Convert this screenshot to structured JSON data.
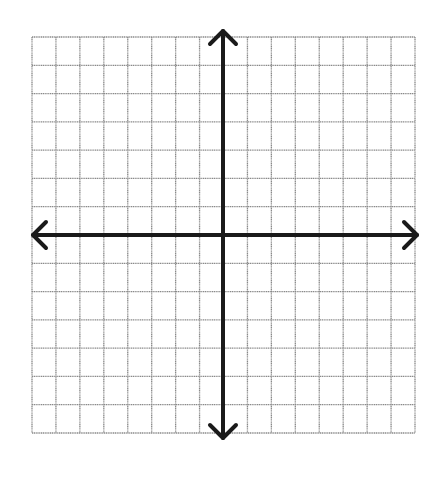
{
  "diagram": {
    "type": "coordinate-plane",
    "grid": {
      "columns": 16,
      "rows": 14,
      "left": 32,
      "top": 37,
      "right": 415,
      "bottom": 433,
      "line_color": "#8a8a8a"
    },
    "axes": {
      "color": "#1a1a1a",
      "x_axis_y": 235,
      "y_axis_x": 223,
      "x_arrow_left": 33,
      "x_arrow_right": 417,
      "y_arrow_top": 31,
      "y_arrow_bottom": 438,
      "arrowheads": [
        "left",
        "right",
        "up",
        "down"
      ]
    },
    "labels": []
  }
}
